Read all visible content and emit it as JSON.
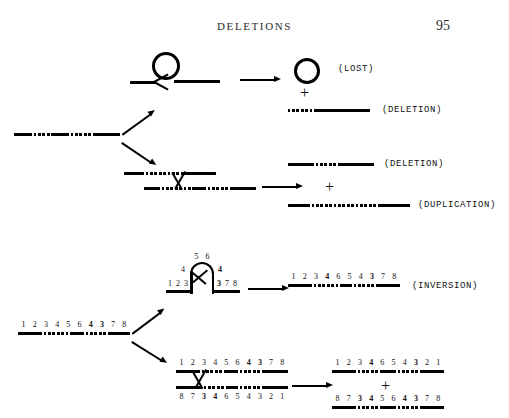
{
  "page": {
    "running_head": "DELETIONS",
    "page_number": "95"
  },
  "figure": {
    "panels": [
      {
        "id": "looping-out",
        "mechanism": "intrastrand-looping",
        "products": [
          {
            "label": "(LOST)",
            "shape": "circle"
          },
          {
            "label": "(DELETION)",
            "shape": "strand"
          }
        ]
      },
      {
        "id": "unequal-crossover",
        "mechanism": "misaligned-pairing-crossover",
        "products": [
          {
            "label": "(DELETION)",
            "shape": "strand"
          },
          {
            "label": "(DUPLICATION)",
            "shape": "strand"
          }
        ]
      },
      {
        "id": "inversion-hairpin",
        "mechanism": "hairpin-loop-inversion",
        "products": [
          {
            "label": "(INVERSION)",
            "shape": "strand"
          }
        ]
      },
      {
        "id": "inversion-crossover",
        "mechanism": "inverted-pairing-crossover",
        "products": [
          {
            "label": "",
            "shape": "strand"
          },
          {
            "label": "",
            "shape": "strand"
          }
        ]
      }
    ],
    "plus_sign": "+",
    "labels": {
      "lost": "(LOST)",
      "deletion": "(DELETION)",
      "deletion2": "(DELETION)",
      "duplication": "(DUPLICATION)",
      "inversion": "(INVERSION)"
    },
    "sequences": {
      "parent_lower": [
        "1",
        "2",
        "3",
        "4",
        "5",
        "6",
        "4",
        "3",
        "7",
        "8"
      ],
      "parent_lower_bold": [
        false,
        false,
        false,
        false,
        false,
        false,
        true,
        true,
        false,
        false
      ],
      "hairpin_top": [
        "5",
        "6"
      ],
      "hairpin_left_arm": [
        "4"
      ],
      "hairpin_right_arm": [
        "4"
      ],
      "hairpin_base_left": [
        "1",
        "2",
        "3"
      ],
      "hairpin_base_right": [
        "3",
        "7",
        "8"
      ],
      "inversion_product": [
        "1",
        "2",
        "3",
        "4",
        "6",
        "5",
        "4",
        "3",
        "7",
        "8"
      ],
      "inversion_product_bold": [
        false,
        false,
        false,
        true,
        false,
        false,
        false,
        true,
        false,
        false
      ],
      "pairing_top": [
        "1",
        "2",
        "3",
        "4",
        "5",
        "6",
        "4",
        "3",
        "7",
        "8"
      ],
      "pairing_top_bold": [
        false,
        false,
        false,
        false,
        false,
        false,
        true,
        true,
        false,
        false
      ],
      "pairing_bottom": [
        "8",
        "7",
        "3",
        "4",
        "6",
        "5",
        "4",
        "3",
        "2",
        "1"
      ],
      "pairing_bottom_bold": [
        false,
        false,
        true,
        true,
        false,
        false,
        true,
        true,
        false,
        false
      ],
      "product_top": [
        "1",
        "2",
        "3",
        "4",
        "6",
        "5",
        "4",
        "3",
        "2",
        "1"
      ],
      "product_top_bold": [
        false,
        false,
        false,
        true,
        false,
        false,
        false,
        true,
        false,
        false
      ],
      "product_bottom": [
        "8",
        "7",
        "3",
        "4",
        "5",
        "6",
        "4",
        "3",
        "7",
        "8"
      ],
      "product_bottom_bold": [
        false,
        false,
        true,
        true,
        false,
        false,
        true,
        true,
        false,
        false
      ]
    }
  }
}
